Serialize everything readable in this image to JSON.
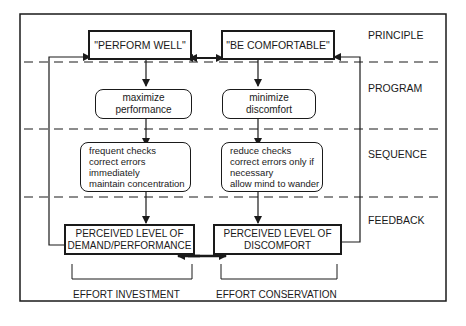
{
  "levels": {
    "principle": "PRINCIPLE",
    "program": "PROGRAM",
    "sequence": "SEQUENCE",
    "feedback": "FEEDBACK"
  },
  "left": {
    "principle": "\"PERFORM WELL\"",
    "program": [
      "maximize",
      "performance"
    ],
    "sequence": [
      "frequent checks",
      "correct errors",
      "immediately",
      "maintain concentration"
    ],
    "feedback": [
      "PERCEIVED LEVEL OF",
      "DEMAND/PERFORMANCE"
    ],
    "effort": "EFFORT INVESTMENT"
  },
  "right": {
    "principle": "\"BE COMFORTABLE\"",
    "program": [
      "minimize",
      "discomfort"
    ],
    "sequence": [
      "reduce checks",
      "correct errors only if",
      "necessary",
      "allow mind to wander"
    ],
    "feedback": [
      "PERCEIVED LEVEL OF",
      "DISCOMFORT"
    ],
    "effort": "EFFORT CONSERVATION"
  },
  "colors": {
    "line": "#1a1a1a",
    "background": "#ffffff"
  }
}
